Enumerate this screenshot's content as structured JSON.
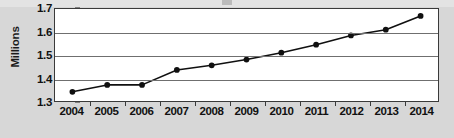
{
  "chart_data": {
    "type": "line",
    "title": "",
    "xlabel": "",
    "ylabel": "Millions",
    "categories": [
      "2004",
      "2005",
      "2006",
      "2007",
      "2008",
      "2009",
      "2010",
      "2011",
      "2012",
      "2013",
      "2014"
    ],
    "values": [
      1.34,
      1.37,
      1.37,
      1.435,
      1.455,
      1.48,
      1.51,
      1.545,
      1.585,
      1.61,
      1.67
    ],
    "series": [
      {
        "name": "Millions",
        "values": [
          1.34,
          1.37,
          1.37,
          1.435,
          1.455,
          1.48,
          1.51,
          1.545,
          1.585,
          1.61,
          1.67
        ]
      }
    ],
    "ylim": [
      1.3,
      1.7
    ],
    "yticks": [
      "1.3",
      "1.4",
      "1.5",
      "1.6",
      "1.7"
    ],
    "ytick_values": [
      1.3,
      1.4,
      1.5,
      1.6,
      1.7
    ],
    "grid": true,
    "legend": "none",
    "marker": "filled-circle",
    "colors": {
      "line": "#101010",
      "marker": "#101010",
      "gridline": "#6f6f6f",
      "plot_background": "#ffffff",
      "figure_background": "#d7d7d7",
      "axis_border": "#3a3a3a",
      "text": "#111111"
    }
  }
}
